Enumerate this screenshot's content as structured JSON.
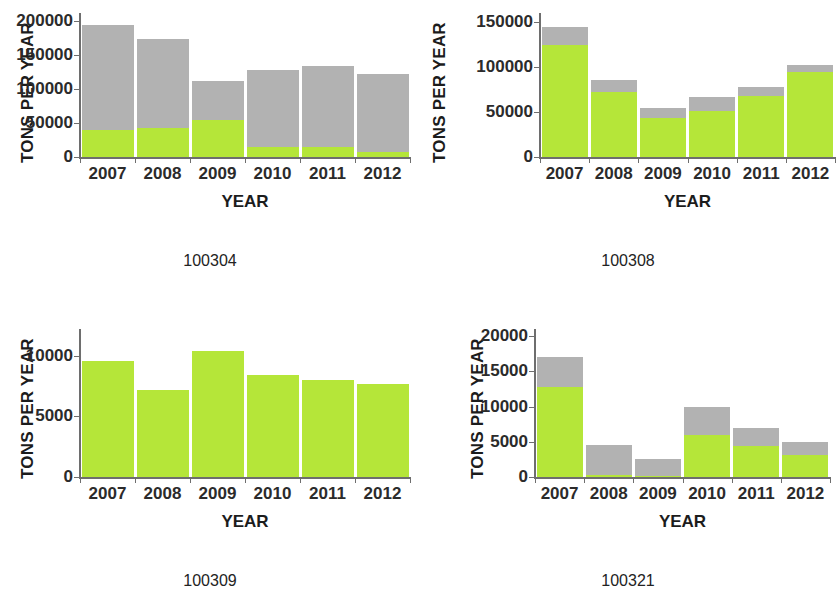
{
  "page": {
    "background": "#ffffff",
    "colors": {
      "green": "#b5e639",
      "gray": "#b2b2b2",
      "axis": "#6e6e6e",
      "text": "#1c1c1c"
    }
  },
  "panels": [
    {
      "caption": "100304",
      "ylabel": "TONS PER YEAR",
      "xlabel": "YEAR",
      "yticks": [
        "0",
        "50000",
        "100000",
        "150000",
        "200000"
      ],
      "xticks": [
        "2007",
        "2008",
        "2009",
        "2010",
        "2011",
        "2012"
      ]
    },
    {
      "caption": "100308",
      "ylabel": "TONS PER YEAR",
      "xlabel": "YEAR",
      "yticks": [
        "0",
        "50000",
        "100000",
        "150000"
      ],
      "xticks": [
        "2007",
        "2008",
        "2009",
        "2010",
        "2011",
        "2012"
      ]
    },
    {
      "caption": "100309",
      "ylabel": "TONS PER YEAR",
      "xlabel": "YEAR",
      "yticks": [
        "0",
        "5000",
        "10000"
      ],
      "xticks": [
        "2007",
        "2008",
        "2009",
        "2010",
        "2011",
        "2012"
      ]
    },
    {
      "caption": "100321",
      "ylabel": "TONS PER YEAR",
      "xlabel": "YEAR",
      "yticks": [
        "0",
        "5000",
        "10000",
        "15000",
        "20000"
      ],
      "xticks": [
        "2007",
        "2008",
        "2009",
        "2010",
        "2011",
        "2012"
      ]
    }
  ],
  "chart_data": [
    {
      "type": "bar",
      "stacked": true,
      "title": "100304",
      "xlabel": "YEAR",
      "ylabel": "TONS PER YEAR",
      "categories": [
        "2007",
        "2008",
        "2009",
        "2010",
        "2011",
        "2012"
      ],
      "series": [
        {
          "name": "green",
          "color": "#b5e639",
          "values": [
            40000,
            42000,
            55000,
            15000,
            15000,
            7000
          ]
        },
        {
          "name": "gray",
          "color": "#b2b2b2",
          "values": [
            155000,
            132000,
            57000,
            113000,
            119000,
            115000
          ]
        }
      ],
      "totals": [
        195000,
        174000,
        112000,
        128000,
        134000,
        122000
      ],
      "ylim": [
        0,
        212000
      ],
      "yticks": [
        0,
        50000,
        100000,
        150000,
        200000
      ],
      "grid": false,
      "legend": "none"
    },
    {
      "type": "bar",
      "stacked": true,
      "title": "100308",
      "xlabel": "YEAR",
      "ylabel": "TONS PER YEAR",
      "categories": [
        "2007",
        "2008",
        "2009",
        "2010",
        "2011",
        "2012"
      ],
      "series": [
        {
          "name": "green",
          "color": "#b5e639",
          "values": [
            125000,
            72000,
            43000,
            51000,
            68000,
            94000
          ]
        },
        {
          "name": "gray",
          "color": "#b2b2b2",
          "values": [
            20000,
            14000,
            12000,
            16000,
            10000,
            8000
          ]
        }
      ],
      "totals": [
        145000,
        86000,
        55000,
        67000,
        78000,
        102000
      ],
      "ylim": [
        0,
        160000
      ],
      "yticks": [
        0,
        50000,
        100000,
        150000
      ],
      "grid": false,
      "legend": "none"
    },
    {
      "type": "bar",
      "stacked": true,
      "title": "100309",
      "xlabel": "YEAR",
      "ylabel": "TONS PER YEAR",
      "categories": [
        "2007",
        "2008",
        "2009",
        "2010",
        "2011",
        "2012"
      ],
      "series": [
        {
          "name": "green",
          "color": "#b5e639",
          "values": [
            9600,
            7200,
            10400,
            8400,
            8000,
            7700
          ]
        },
        {
          "name": "gray",
          "color": "#b2b2b2",
          "values": [
            0,
            0,
            0,
            0,
            0,
            0
          ]
        }
      ],
      "totals": [
        9600,
        7200,
        10400,
        8400,
        8000,
        7700
      ],
      "ylim": [
        0,
        12200
      ],
      "yticks": [
        0,
        5000,
        10000
      ],
      "grid": false,
      "legend": "none"
    },
    {
      "type": "bar",
      "stacked": true,
      "title": "100321",
      "xlabel": "YEAR",
      "ylabel": "TONS PER YEAR",
      "categories": [
        "2007",
        "2008",
        "2009",
        "2010",
        "2011",
        "2012"
      ],
      "series": [
        {
          "name": "green",
          "color": "#b5e639",
          "values": [
            12800,
            300,
            200,
            5900,
            4400,
            3100
          ]
        },
        {
          "name": "gray",
          "color": "#b2b2b2",
          "values": [
            4200,
            4200,
            2400,
            4000,
            2600,
            1900
          ]
        }
      ],
      "totals": [
        17000,
        4500,
        2600,
        9900,
        7000,
        5000
      ],
      "ylim": [
        0,
        21000
      ],
      "yticks": [
        0,
        5000,
        10000,
        15000,
        20000
      ],
      "grid": false,
      "legend": "none"
    }
  ]
}
